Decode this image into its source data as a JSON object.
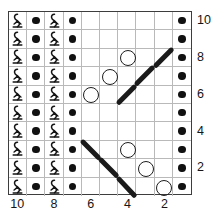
{
  "chart_data": {
    "type": "table",
    "title": "",
    "subtitle": "",
    "xlabel": "",
    "ylabel": "",
    "grid": true,
    "legend_position": "none",
    "columns": 10,
    "rows": 10,
    "column_order": "right-to-left",
    "row_order": "bottom-to-top",
    "column_tick_labels": [
      "10",
      "8",
      "6",
      "4",
      "2"
    ],
    "column_tick_positions": [
      10,
      8,
      6,
      4,
      2
    ],
    "row_tick_labels": [
      "10",
      "8",
      "6",
      "4",
      "2"
    ],
    "row_tick_positions": [
      10,
      8,
      6,
      4,
      2
    ],
    "symbol_legend": {
      "twist": "twisted-stitch",
      "dot": "purl-stitch",
      "circle": "yarn-over",
      "diag_up": "right-leaning-travel",
      "diag_down": "left-leaning-travel",
      "blank": "knit-stitch"
    },
    "cells": [
      {
        "row": 10,
        "symbols": [
          "twist",
          "dot",
          "twist",
          "dot",
          "blank",
          "blank",
          "blank",
          "blank",
          "blank",
          "dot"
        ]
      },
      {
        "row": 9,
        "symbols": [
          "twist",
          "dot",
          "twist",
          "dot",
          "blank",
          "blank",
          "blank",
          "blank",
          "blank",
          "dot"
        ]
      },
      {
        "row": 8,
        "symbols": [
          "twist",
          "dot",
          "twist",
          "dot",
          "blank",
          "blank",
          "circle",
          "blank",
          "diag_up",
          "dot"
        ]
      },
      {
        "row": 7,
        "symbols": [
          "twist",
          "dot",
          "twist",
          "dot",
          "blank",
          "circle",
          "blank",
          "diag_up",
          "blank",
          "dot"
        ]
      },
      {
        "row": 6,
        "symbols": [
          "twist",
          "dot",
          "twist",
          "dot",
          "circle",
          "blank",
          "diag_up",
          "blank",
          "blank",
          "dot"
        ]
      },
      {
        "row": 5,
        "symbols": [
          "twist",
          "dot",
          "twist",
          "dot",
          "blank",
          "blank",
          "blank",
          "blank",
          "blank",
          "dot"
        ]
      },
      {
        "row": 4,
        "symbols": [
          "twist",
          "dot",
          "twist",
          "dot",
          "blank",
          "blank",
          "blank",
          "blank",
          "blank",
          "dot"
        ]
      },
      {
        "row": 3,
        "symbols": [
          "twist",
          "dot",
          "twist",
          "dot",
          "diag_down",
          "blank",
          "circle",
          "blank",
          "blank",
          "dot"
        ]
      },
      {
        "row": 2,
        "symbols": [
          "twist",
          "dot",
          "twist",
          "dot",
          "blank",
          "diag_down",
          "blank",
          "circle",
          "blank",
          "dot"
        ]
      },
      {
        "row": 1,
        "symbols": [
          "twist",
          "dot",
          "twist",
          "dot",
          "blank",
          "blank",
          "diag_down",
          "blank",
          "circle",
          "dot"
        ]
      }
    ]
  }
}
